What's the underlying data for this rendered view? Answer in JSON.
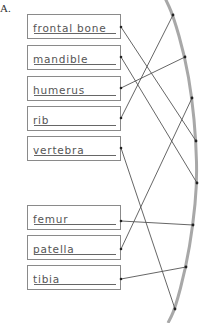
{
  "section_label": "A.",
  "bones": [
    {
      "label": "frontal bone",
      "top": 14,
      "anchor": [
        121,
        27
      ]
    },
    {
      "label": "mandible",
      "top": 45,
      "anchor": [
        121,
        57
      ]
    },
    {
      "label": "humerus",
      "top": 76,
      "anchor": [
        121,
        88
      ]
    },
    {
      "label": "rib",
      "top": 106,
      "anchor": [
        121,
        118
      ]
    },
    {
      "label": "vertebra",
      "top": 136,
      "anchor": [
        121,
        148
      ]
    },
    {
      "label": "femur",
      "top": 205,
      "anchor": [
        121,
        221
      ]
    },
    {
      "label": "patella",
      "top": 235,
      "anchor": [
        121,
        249
      ]
    },
    {
      "label": "tibia",
      "top": 265,
      "anchor": [
        121,
        279
      ]
    }
  ],
  "arc_points": [
    [
      173,
      15
    ],
    [
      185,
      57
    ],
    [
      192,
      98
    ],
    [
      196,
      141
    ],
    [
      197,
      183
    ],
    [
      193,
      225
    ],
    [
      186,
      267
    ],
    [
      175,
      309
    ]
  ],
  "connections": [
    {
      "from": "frontal bone",
      "to_point": 3
    },
    {
      "from": "mandible",
      "to_point": 4
    },
    {
      "from": "humerus",
      "to_point": 1
    },
    {
      "from": "rib",
      "to_point": 0
    },
    {
      "from": "vertebra",
      "to_point": 7
    },
    {
      "from": "femur",
      "to_point": 5
    },
    {
      "from": "patella",
      "to_point": 2
    },
    {
      "from": "tibia",
      "to_point": 6
    }
  ],
  "colors": {
    "arc": "#a8a8a8",
    "line": "#555555",
    "dot": "#222222",
    "box_border": "#8a8a8a"
  }
}
